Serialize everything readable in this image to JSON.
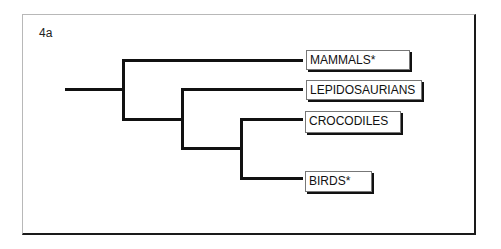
{
  "figure": {
    "label": "4a"
  },
  "tree": {
    "taxa": [
      {
        "name": "MAMMALS*"
      },
      {
        "name": "LEPIDOSAURIANS"
      },
      {
        "name": "CROCODILES"
      },
      {
        "name": "BIRDS*"
      }
    ],
    "topology": "(MAMMALS*, (LEPIDOSAURIANS, (CROCODILES, BIRDS*)))"
  }
}
